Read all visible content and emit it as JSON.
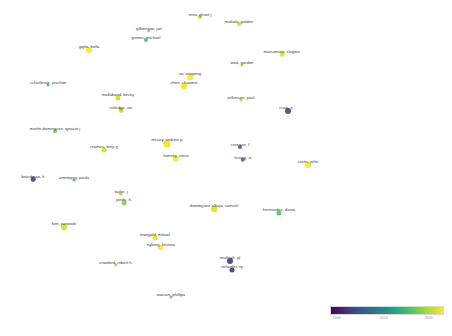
{
  "figure": {
    "type": "scatter-network",
    "title": "",
    "background": "#ffffff",
    "width": 452,
    "height": 336
  },
  "legend": {
    "name": "year-colorbar",
    "colormap": "viridis",
    "orientation": "horizontal",
    "min": 2000,
    "max": 2020,
    "ticks": [
      {
        "label": "2000",
        "pos": 0.06
      },
      {
        "label": "2010",
        "pos": 0.48
      },
      {
        "label": "2020",
        "pos": 0.88
      }
    ],
    "gradient_stops": [
      "#440154",
      "#46327e",
      "#365c8d",
      "#277f8e",
      "#1fa187",
      "#4ac16d",
      "#a0da39",
      "#fde725"
    ]
  },
  "chart_data": {
    "type": "scatter",
    "title": "",
    "xlabel": "",
    "ylabel": "",
    "colorbar_label": "year",
    "nodes": [
      {
        "label": "rena, ghunt j",
        "x": 200,
        "y": 17,
        "r": 2.1,
        "color": "#c7e020",
        "year": 2019,
        "label_dx": 0,
        "label_dy": 4
      },
      {
        "label": "makala, golden",
        "x": 239,
        "y": 24,
        "r": 1.9,
        "color": "#d8e219",
        "year": 2020,
        "label_dx": 0,
        "label_dy": 4
      },
      {
        "label": "gilbertson, jan",
        "x": 149,
        "y": 31,
        "r": 1.7,
        "color": "#8fd744",
        "year": 2016,
        "label_dx": 0,
        "label_dy": 4
      },
      {
        "label": "grimes, michael",
        "x": 146,
        "y": 40,
        "r": 2.0,
        "color": "#4ac16d",
        "year": 2013,
        "label_dx": 0,
        "label_dy": 4
      },
      {
        "label": "giglio, bella",
        "x": 89,
        "y": 50,
        "r": 3.1,
        "color": "#fde725",
        "year": 2021,
        "label_dx": 0,
        "label_dy": 5
      },
      {
        "label": "matsumoto, shigeru",
        "x": 282,
        "y": 54,
        "r": 2.3,
        "color": "#e5e419",
        "year": 2020,
        "label_dx": 0,
        "label_dy": 4
      },
      {
        "label": "watt, gordon",
        "x": 242,
        "y": 65,
        "r": 1.6,
        "color": "#c8e020",
        "year": 2019,
        "label_dx": 0,
        "label_dy": 4
      },
      {
        "label": "schiellerup, joachim",
        "x": 48,
        "y": 85,
        "r": 1.5,
        "color": "#56c667",
        "year": 2014,
        "label_dx": 0,
        "label_dy": 4
      },
      {
        "label": "xu, xiaoping",
        "x": 190,
        "y": 77,
        "r": 2.8,
        "color": "#fde725",
        "year": 2021,
        "label_dx": 0,
        "label_dy": 5
      },
      {
        "label": "chen, chaomei",
        "x": 184,
        "y": 86,
        "r": 2.9,
        "color": "#f1e51d",
        "year": 2021,
        "label_dx": 0,
        "label_dy": 5
      },
      {
        "label": "mallaband, becky",
        "x": 118,
        "y": 98,
        "r": 2.6,
        "color": "#d0e11c",
        "year": 2020,
        "label_dx": 0,
        "label_dy": 5
      },
      {
        "label": "rutledge, ian",
        "x": 121,
        "y": 110,
        "r": 2.3,
        "color": "#c2e021",
        "year": 2019,
        "label_dx": 0,
        "label_dy": 5
      },
      {
        "label": "wilkinson, paul",
        "x": 241,
        "y": 100,
        "r": 1.6,
        "color": "#bddf26",
        "year": 2019,
        "label_dx": 0,
        "label_dy": 4
      },
      {
        "label": "craig, p",
        "x": 288,
        "y": 111,
        "r": 3.0,
        "color": "#3b518b",
        "year": 2004,
        "label_dx": -2,
        "label_dy": 4
      },
      {
        "label": "martin-dominguez, ignacio j",
        "x": 55,
        "y": 131,
        "r": 1.8,
        "color": "#7ad151",
        "year": 2016,
        "label_dx": 0,
        "label_dy": 4
      },
      {
        "label": "reames, tony g",
        "x": 104,
        "y": 150,
        "r": 2.4,
        "color": "#d5e21a",
        "year": 2020,
        "label_dx": 0,
        "label_dy": 4
      },
      {
        "label": "mccoy, andrew p",
        "x": 167,
        "y": 144,
        "r": 3.4,
        "color": "#f4e61e",
        "year": 2021,
        "label_dx": 0,
        "label_dy": 4
      },
      {
        "label": "hanney, steve",
        "x": 176,
        "y": 159,
        "r": 3.2,
        "color": "#fde725",
        "year": 2021,
        "label_dx": 0,
        "label_dy": 4
      },
      {
        "label": "creegan, f",
        "x": 240,
        "y": 147,
        "r": 2.0,
        "color": "#2d708e",
        "year": 2009,
        "label_dx": 0,
        "label_dy": 4
      },
      {
        "label": "huang, xi",
        "x": 243,
        "y": 160,
        "r": 2.2,
        "color": "#2a788e",
        "year": 2010,
        "label_dx": 0,
        "label_dy": 4
      },
      {
        "label": "curtis, john",
        "x": 308,
        "y": 165,
        "r": 2.9,
        "color": "#fde725",
        "year": 2021,
        "label_dx": 0,
        "label_dy": 4
      },
      {
        "label": "boardman, h",
        "x": 33,
        "y": 179,
        "r": 2.3,
        "color": "#3f4788",
        "year": 2005,
        "label_dx": 0,
        "label_dy": 4
      },
      {
        "label": "ametepey, paula",
        "x": 74,
        "y": 180,
        "r": 1.5,
        "color": "#46c06f",
        "year": 2014,
        "label_dx": 0,
        "label_dy": 4
      },
      {
        "label": "taylor, j",
        "x": 121,
        "y": 194,
        "r": 1.6,
        "color": "#a5db36",
        "year": 2018,
        "label_dx": 0,
        "label_dy": 4
      },
      {
        "label": "janda, h.",
        "x": 124,
        "y": 203,
        "r": 2.4,
        "color": "#82d34d",
        "year": 2017,
        "label_dx": 0,
        "label_dy": 4
      },
      {
        "label": "dominguez-albaja, samuel",
        "x": 214,
        "y": 209,
        "r": 2.8,
        "color": "#dde318",
        "year": 2020,
        "label_dx": 0,
        "label_dy": 4
      },
      {
        "label": "hernandez, diana",
        "x": 279,
        "y": 213,
        "r": 2.6,
        "color": "#52c569",
        "year": 2014,
        "label_dx": 0,
        "label_dy": 4
      },
      {
        "label": "kim, jaewook",
        "x": 64,
        "y": 227,
        "r": 2.9,
        "color": "#d2e21b",
        "year": 2020,
        "label_dx": 0,
        "label_dy": 4
      },
      {
        "label": "mangold, mikael",
        "x": 155,
        "y": 238,
        "r": 2.4,
        "color": "#e7e419",
        "year": 2020,
        "label_dx": 0,
        "label_dy": 4
      },
      {
        "label": "nyborg, kristina",
        "x": 161,
        "y": 248,
        "r": 2.7,
        "color": "#fde725",
        "year": 2021,
        "label_dx": 0,
        "label_dy": 4
      },
      {
        "label": "muthiah, gl",
        "x": 230,
        "y": 261,
        "r": 3.0,
        "color": "#433e85",
        "year": 2006,
        "label_dx": 0,
        "label_dy": 4
      },
      {
        "label": "schaefer, rg",
        "x": 232,
        "y": 270,
        "r": 2.5,
        "color": "#453781",
        "year": 2005,
        "label_dx": 0,
        "label_dy": 4
      },
      {
        "label": "crawford, robert h.",
        "x": 116,
        "y": 265,
        "r": 1.6,
        "color": "#a2da37",
        "year": 2018,
        "label_dx": 0,
        "label_dy": 4
      },
      {
        "label": "watson, phillipa",
        "x": 171,
        "y": 297,
        "r": 1.5,
        "color": "#6ece58",
        "year": 2015,
        "label_dx": 0,
        "label_dy": 4
      }
    ]
  }
}
